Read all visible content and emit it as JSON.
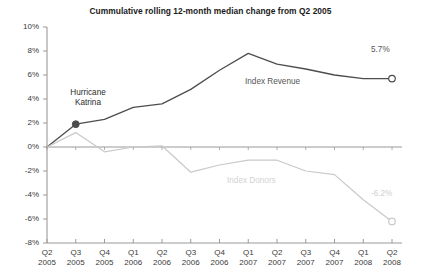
{
  "chart_data": {
    "type": "line",
    "title": "Cummulative rolling 12-month median change from Q2 2005",
    "xlabel": "",
    "ylabel": "",
    "ylim": [
      -8,
      10
    ],
    "grid": false,
    "legend_position": "inline-labels",
    "categories": [
      "Q2 2005",
      "Q3 2005",
      "Q4 2005",
      "Q1 2006",
      "Q2 2006",
      "Q3 2006",
      "Q4 2006",
      "Q1 2007",
      "Q2 2007",
      "Q3 2007",
      "Q4 2007",
      "Q1 2008",
      "Q2 2008"
    ],
    "x_tick_quarters": [
      "Q2",
      "Q3",
      "Q4",
      "Q1",
      "Q2",
      "Q3",
      "Q4",
      "Q1",
      "Q2",
      "Q3",
      "Q4",
      "Q1",
      "Q2"
    ],
    "x_tick_years": [
      "2005",
      "2005",
      "2005",
      "2006",
      "2006",
      "2006",
      "2006",
      "2007",
      "2007",
      "2007",
      "2007",
      "2008",
      "2008"
    ],
    "y_tick_labels": [
      "10%",
      "8%",
      "6%",
      "4%",
      "2%",
      "0%",
      "-2%",
      "-4%",
      "-6%",
      "-8%"
    ],
    "y_tick_values": [
      10,
      8,
      6,
      4,
      2,
      0,
      -2,
      -4,
      -6,
      -8
    ],
    "series": [
      {
        "name": "Index Revenue",
        "color": "#4d4d4d",
        "values": [
          0.0,
          1.9,
          2.3,
          3.3,
          3.6,
          4.8,
          6.4,
          7.8,
          6.9,
          6.5,
          6.0,
          5.7,
          5.7
        ],
        "end_label": "5.7%",
        "end_marker": "hollow-circle"
      },
      {
        "name": "Index Donors",
        "color": "#c9c9c9",
        "values": [
          0.0,
          1.2,
          -0.4,
          0.0,
          0.1,
          -2.1,
          -1.5,
          -1.1,
          -1.1,
          -2.0,
          -2.3,
          -4.4,
          -6.2
        ],
        "end_label": "-6.2%",
        "end_marker": "hollow-circle"
      }
    ],
    "annotations": [
      {
        "id": "hurricane-katrina",
        "line1": "Hurricane",
        "line2": "Katrina",
        "category": "Q3 2005",
        "value": 1.9,
        "marker": "filled-circle",
        "marker_color": "#4d4d4d"
      }
    ]
  },
  "axis": {
    "zero_line_label": "0%",
    "axis_color": "#9a9a9a"
  }
}
